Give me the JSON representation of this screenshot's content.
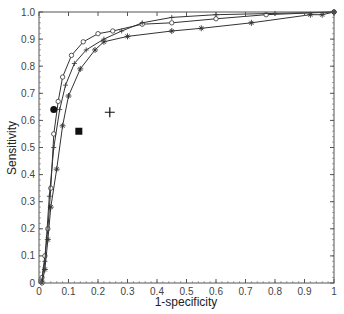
{
  "chart_data": {
    "type": "line",
    "title": "",
    "xlabel": "1-specificity",
    "ylabel": "Sensitivity",
    "xlim": [
      0,
      1
    ],
    "ylim": [
      0,
      1
    ],
    "grid": false,
    "legend": null,
    "x_ticks": [
      0,
      0.1,
      0.2,
      0.3,
      0.4,
      0.5,
      0.6,
      0.7,
      0.8,
      0.9,
      1
    ],
    "x_tick_labels": [
      "0",
      "0.1",
      "0.2",
      "0.3",
      "0.4",
      "0.5",
      "0.6",
      "0.7",
      "0.8",
      "0.9",
      "1"
    ],
    "y_ticks": [
      0,
      0.1,
      0.2,
      0.3,
      0.4,
      0.5,
      0.6,
      0.7,
      0.8,
      0.9,
      1.0
    ],
    "y_tick_labels": [
      "0",
      "0.1",
      "0.2",
      "0.3",
      "0.4",
      "0.5",
      "0.6",
      "0.7",
      "0.8",
      "0.9",
      "1.0"
    ],
    "series": [
      {
        "name": "curve-circle",
        "marker": "circle",
        "points": [
          [
            0.01,
            0.02
          ],
          [
            0.02,
            0.1
          ],
          [
            0.03,
            0.2
          ],
          [
            0.04,
            0.35
          ],
          [
            0.05,
            0.55
          ],
          [
            0.065,
            0.67
          ],
          [
            0.08,
            0.76
          ],
          [
            0.11,
            0.84
          ],
          [
            0.15,
            0.89
          ],
          [
            0.2,
            0.92
          ],
          [
            0.25,
            0.93
          ],
          [
            0.35,
            0.955
          ],
          [
            0.45,
            0.96
          ],
          [
            0.6,
            0.975
          ],
          [
            0.77,
            0.99
          ],
          [
            1,
            1
          ]
        ]
      },
      {
        "name": "curve-plus",
        "marker": "plus",
        "points": [
          [
            0.01,
            0.01
          ],
          [
            0.02,
            0.08
          ],
          [
            0.035,
            0.32
          ],
          [
            0.05,
            0.5
          ],
          [
            0.07,
            0.64
          ],
          [
            0.09,
            0.73
          ],
          [
            0.12,
            0.81
          ],
          [
            0.16,
            0.86
          ],
          [
            0.22,
            0.9
          ],
          [
            0.28,
            0.93
          ],
          [
            0.35,
            0.96
          ],
          [
            0.45,
            0.98
          ],
          [
            0.6,
            0.99
          ],
          [
            0.8,
            0.995
          ],
          [
            1,
            1
          ]
        ]
      },
      {
        "name": "curve-star",
        "marker": "star",
        "points": [
          [
            0.01,
            0.0
          ],
          [
            0.02,
            0.05
          ],
          [
            0.03,
            0.16
          ],
          [
            0.04,
            0.28
          ],
          [
            0.06,
            0.42
          ],
          [
            0.08,
            0.58
          ],
          [
            0.1,
            0.69
          ],
          [
            0.14,
            0.79
          ],
          [
            0.19,
            0.86
          ],
          [
            0.22,
            0.89
          ],
          [
            0.3,
            0.91
          ],
          [
            0.45,
            0.93
          ],
          [
            0.55,
            0.94
          ],
          [
            0.72,
            0.96
          ],
          [
            0.92,
            0.99
          ],
          [
            0.96,
            0.99
          ],
          [
            1,
            1
          ]
        ]
      }
    ],
    "single_points": [
      {
        "name": "filled-circle-point",
        "marker": "filled-circle",
        "x": 0.05,
        "y": 0.64
      },
      {
        "name": "filled-square-point",
        "marker": "filled-square",
        "x": 0.135,
        "y": 0.56
      },
      {
        "name": "plus-point",
        "marker": "large-plus",
        "x": 0.24,
        "y": 0.63
      }
    ]
  },
  "colors": {
    "line": "#333333",
    "axis": "#555555",
    "marker_fill": "#111111"
  }
}
